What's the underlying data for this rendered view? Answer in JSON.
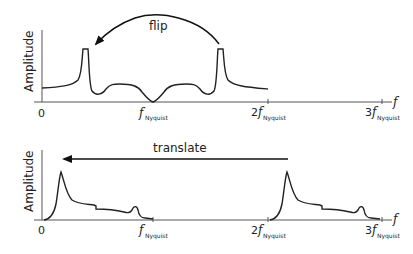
{
  "top_panel": {
    "ylabel": "Amplitude",
    "x_axis_symbol": "f",
    "arrow_label": "flip",
    "ticks": [
      {
        "prefix": "0",
        "symbol": "",
        "sub": ""
      },
      {
        "prefix": "",
        "symbol": "f",
        "sub": "Nyquist"
      },
      {
        "prefix": "2",
        "symbol": "f",
        "sub": "Nyquist"
      },
      {
        "prefix": "3",
        "symbol": "f",
        "sub": "Nyquist"
      }
    ]
  },
  "bottom_panel": {
    "ylabel": "Amplitude",
    "x_axis_symbol": "f",
    "arrow_label": "translate",
    "ticks": [
      {
        "prefix": "0",
        "symbol": "",
        "sub": ""
      },
      {
        "prefix": "",
        "symbol": "f",
        "sub": "Nyquist"
      },
      {
        "prefix": "2",
        "symbol": "f",
        "sub": "Nyquist"
      },
      {
        "prefix": "3",
        "symbol": "f",
        "sub": "Nyquist"
      }
    ]
  },
  "colors": {
    "line": "#222222",
    "axis": "#555555"
  }
}
